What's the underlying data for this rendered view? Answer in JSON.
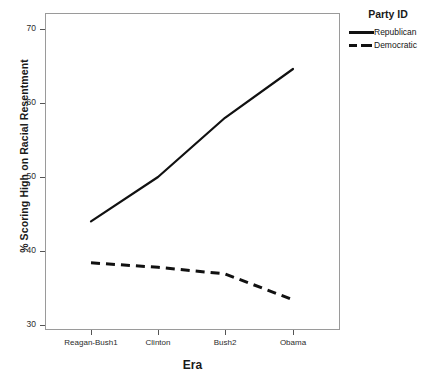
{
  "chart_data": {
    "type": "line",
    "title": "",
    "xlabel": "Era",
    "ylabel": "% Scoring High on Racial Resentment",
    "categories": [
      "Reagan-Bush1",
      "Clinton",
      "Bush2",
      "Obama"
    ],
    "yticks": [
      30,
      40,
      50,
      60,
      70
    ],
    "ylim": [
      28,
      72
    ],
    "grid": false,
    "legend_position": "right-top",
    "legend_title": "Party ID",
    "series": [
      {
        "name": "Republican",
        "style": "solid",
        "color": "#111111",
        "values": [
          44.0,
          50.0,
          58.0,
          64.6
        ]
      },
      {
        "name": "Democratic",
        "style": "dashed",
        "color": "#111111",
        "values": [
          38.4,
          37.8,
          36.9,
          33.4
        ]
      }
    ]
  },
  "axes": {
    "y_title": "% Scoring High on Racial Resentment",
    "x_title": "Era",
    "y_tick_labels": [
      "70",
      "60",
      "50",
      "40",
      "30"
    ],
    "x_tick_labels": [
      "Reagan-Bush1",
      "Clinton",
      "Bush2",
      "Obama"
    ]
  },
  "legend": {
    "title": "Party ID",
    "entries": [
      {
        "label": "Republican",
        "swatch": "solid-line-swatch"
      },
      {
        "label": "Democratic",
        "swatch": "dashed-line-swatch"
      }
    ]
  }
}
